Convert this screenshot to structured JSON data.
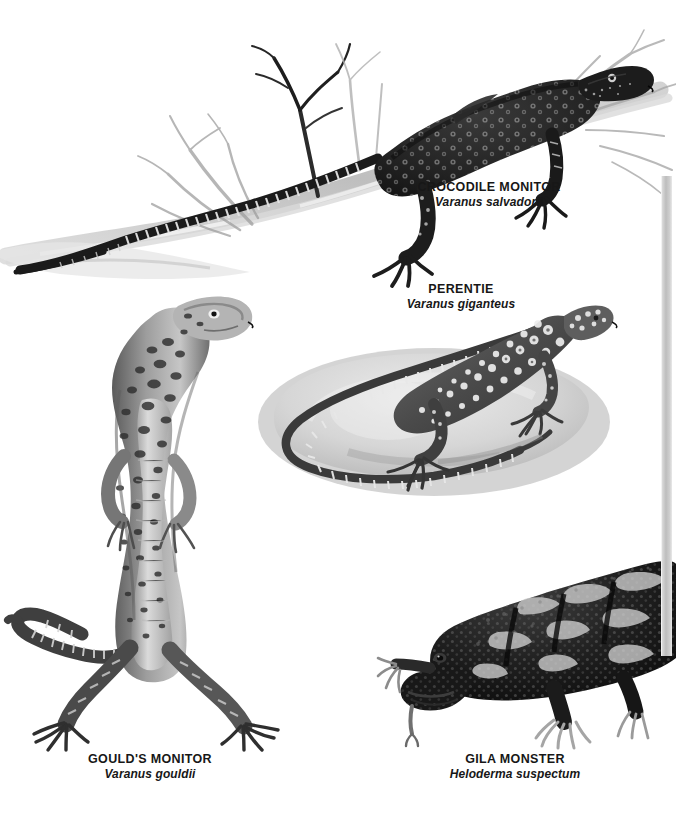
{
  "page": {
    "background_color": "#ffffff",
    "width": 676,
    "height": 818,
    "plate_type": "natural-history illustration plate"
  },
  "edge_strip": {
    "name": "page-edge-shadow",
    "color": "#bdbdbd"
  },
  "figures": [
    {
      "id": "crocodile-monitor",
      "common_name": "CROCODILE MONITOR",
      "scientific_name": "Varanus salvadorii",
      "pose": "climbing along a bare branch, head to upper right, long banded tail trailing to lower left",
      "habitat_element": "dead tree branch with fine twigs",
      "body_tone": "#1f1f1f",
      "marking": "pale ocelli rosettes",
      "tail_marking": "black and white bands"
    },
    {
      "id": "perentie",
      "common_name": "PERENTIE",
      "scientific_name": "Varanus giganteus",
      "pose": "resting flat on a pale boulder, body curving left, tail looped forward",
      "habitat_element": "rounded grey boulder with soft cast shadow",
      "body_tone": "#4a4a4a",
      "marking": "cream ocelli in rows",
      "tail_marking": "pale banded rings"
    },
    {
      "id": "goulds-monitor",
      "common_name": "GOULD'S MONITOR",
      "scientific_name": "Varanus gouldii",
      "pose": "reared upright on hind legs, head raised and turned right, tail curving to the left",
      "habitat_element": "none",
      "body_tone": "#6e6e6e",
      "marking": "dark blotches and speckles over pale ground",
      "tail_marking": "dark ringed tail"
    },
    {
      "id": "gila-monster",
      "common_name": "GILA MONSTER",
      "scientific_name": "Heloderma suspectum",
      "pose": "walking toward the viewer, head low at lower left, tongue extended",
      "habitat_element": "none",
      "body_tone": "#151515",
      "marking": "beaded black body with pale blotchy crossbands",
      "tail_marking": "banded"
    }
  ],
  "colors": {
    "ink_dark": "#171717",
    "ink_mid": "#595959",
    "ink_light": "#b5b5b5",
    "paper": "#ffffff",
    "rock": "#d2d2d2",
    "shadow": "#a9a9a9"
  }
}
